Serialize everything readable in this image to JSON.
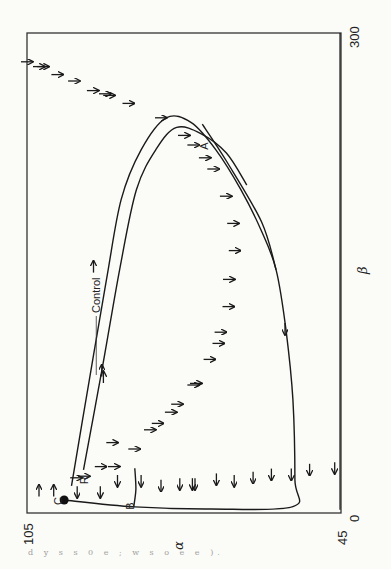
{
  "chart_data": {
    "type": "line",
    "title": "",
    "orientation": "rotated-90",
    "xlabel": "α",
    "ylabel": "β",
    "xlim": [
      105,
      45
    ],
    "ylim": [
      0,
      300
    ],
    "x_ticks": [
      "105",
      "45"
    ],
    "y_ticks": [
      "300",
      "0"
    ],
    "grid": false,
    "annotations": [
      {
        "text": "Control",
        "alpha": 91.0,
        "beta": 125
      },
      {
        "text": "A",
        "alpha": 70.5,
        "beta": 227
      },
      {
        "text": "B",
        "alpha": 84.6,
        "beta": 2
      },
      {
        "text": "C",
        "alpha": 98.3,
        "beta": 5
      },
      {
        "text": "R",
        "alpha": 93.3,
        "beta": 18
      }
    ],
    "points": [
      {
        "name": "C",
        "alpha": 97.9,
        "beta": 8.1
      }
    ],
    "series": [
      {
        "name": "outer-trajectory",
        "points": [
          [
            96.5,
            17
          ],
          [
            93.1,
            83
          ],
          [
            89.8,
            146
          ],
          [
            87.0,
            196
          ],
          [
            83.2,
            227
          ],
          [
            78.4,
            247
          ],
          [
            73.6,
            244
          ],
          [
            68.9,
            227
          ],
          [
            64.1,
            202
          ],
          [
            60.3,
            177
          ],
          [
            57.4,
            152
          ],
          [
            55.5,
            114
          ],
          [
            54.2,
            71
          ],
          [
            53.8,
            21
          ],
          [
            54.2,
            4
          ],
          [
            70.0,
            2.5
          ],
          [
            84.4,
            3.8
          ],
          [
            97.9,
            8.1
          ]
        ]
      },
      {
        "name": "inner-trajectory",
        "points": [
          [
            94.2,
            27
          ],
          [
            90.7,
            89
          ],
          [
            87.3,
            152
          ],
          [
            84.1,
            202
          ],
          [
            80.2,
            228
          ],
          [
            76.4,
            241
          ],
          [
            71.7,
            237
          ],
          [
            66.9,
            225
          ],
          [
            63.0,
            205
          ]
        ]
      },
      {
        "name": "tangent-A",
        "points": [
          [
            71.5,
            243
          ],
          [
            66.9,
            220
          ],
          [
            60.2,
            182
          ],
          [
            57.4,
            152
          ]
        ]
      },
      {
        "name": "B-branch",
        "points": [
          [
            84.6,
            4
          ],
          [
            84.2,
            15
          ],
          [
            84.4,
            28
          ]
        ]
      },
      {
        "name": "right-boundary",
        "points": [
          [
            45.2,
            300
          ],
          [
            45.2,
            2
          ]
        ]
      }
    ],
    "arrows": [
      {
        "alpha": 105.0,
        "beta": 282,
        "dir": "right"
      },
      {
        "alpha": 102.7,
        "beta": 279,
        "dir": "right"
      },
      {
        "alpha": 101.9,
        "beta": 279,
        "dir": "right"
      },
      {
        "alpha": 99.2,
        "beta": 274,
        "dir": "right"
      },
      {
        "alpha": 96.0,
        "beta": 270,
        "dir": "right"
      },
      {
        "alpha": 92.4,
        "beta": 264,
        "dir": "right"
      },
      {
        "alpha": 90.1,
        "beta": 262,
        "dir": "right"
      },
      {
        "alpha": 89.3,
        "beta": 261,
        "dir": "right"
      },
      {
        "alpha": 85.6,
        "beta": 256,
        "dir": "right"
      },
      {
        "alpha": 79.4,
        "beta": 247,
        "dir": "right"
      },
      {
        "alpha": 75.0,
        "beta": 236,
        "dir": "right"
      },
      {
        "alpha": 73.2,
        "beta": 230,
        "dir": "right"
      },
      {
        "alpha": 71.0,
        "beta": 222,
        "dir": "right"
      },
      {
        "alpha": 69.4,
        "beta": 215,
        "dir": "right"
      },
      {
        "alpha": 67.0,
        "beta": 198,
        "dir": "right"
      },
      {
        "alpha": 65.6,
        "beta": 181,
        "dir": "right"
      },
      {
        "alpha": 65.3,
        "beta": 164,
        "dir": "right"
      },
      {
        "alpha": 66.4,
        "beta": 146,
        "dir": "right"
      },
      {
        "alpha": 66.5,
        "beta": 129,
        "dir": "right"
      },
      {
        "alpha": 68.0,
        "beta": 113,
        "dir": "right"
      },
      {
        "alpha": 68.4,
        "beta": 106,
        "dir": "right"
      },
      {
        "alpha": 70.1,
        "beta": 96,
        "dir": "right"
      },
      {
        "alpha": 72.7,
        "beta": 81,
        "dir": "right"
      },
      {
        "alpha": 73.2,
        "beta": 80,
        "dir": "right"
      },
      {
        "alpha": 76.3,
        "beta": 68,
        "dir": "right"
      },
      {
        "alpha": 77.5,
        "beta": 63,
        "dir": "right"
      },
      {
        "alpha": 80.0,
        "beta": 56,
        "dir": "right"
      },
      {
        "alpha": 81.5,
        "beta": 52,
        "dir": "right"
      },
      {
        "alpha": 84.5,
        "beta": 40,
        "dir": "right"
      },
      {
        "alpha": 88.7,
        "beta": 44,
        "dir": "right"
      },
      {
        "alpha": 88.4,
        "beta": 29,
        "dir": "right"
      },
      {
        "alpha": 90.9,
        "beta": 29,
        "dir": "right"
      },
      {
        "alpha": 94.1,
        "beta": 23,
        "dir": "right"
      },
      {
        "alpha": 95.6,
        "beta": 22,
        "dir": "right"
      },
      {
        "alpha": 102.7,
        "beta": 14,
        "dir": "up"
      },
      {
        "alpha": 99.9,
        "beta": 14,
        "dir": "up"
      },
      {
        "alpha": 95.4,
        "beta": 13,
        "dir": "down"
      },
      {
        "alpha": 91.0,
        "beta": 13,
        "dir": "down"
      },
      {
        "alpha": 87.7,
        "beta": 20,
        "dir": "down"
      },
      {
        "alpha": 83.2,
        "beta": 20,
        "dir": "down"
      },
      {
        "alpha": 79.4,
        "beta": 17,
        "dir": "down"
      },
      {
        "alpha": 75.8,
        "beta": 18,
        "dir": "down"
      },
      {
        "alpha": 73.4,
        "beta": 18,
        "dir": "down"
      },
      {
        "alpha": 72.9,
        "beta": 18,
        "dir": "down"
      },
      {
        "alpha": 68.8,
        "beta": 21,
        "dir": "down"
      },
      {
        "alpha": 65.4,
        "beta": 20,
        "dir": "down"
      },
      {
        "alpha": 61.8,
        "beta": 22,
        "dir": "down"
      },
      {
        "alpha": 58.3,
        "beta": 24,
        "dir": "down"
      },
      {
        "alpha": 54.5,
        "beta": 24,
        "dir": "down"
      },
      {
        "alpha": 51.0,
        "beta": 27,
        "dir": "down"
      },
      {
        "alpha": 46.2,
        "beta": 28,
        "dir": "down"
      },
      {
        "alpha": 55.7,
        "beta": 115,
        "dir": "down"
      },
      {
        "alpha": 92.3,
        "beta": 154,
        "dir": "up"
      },
      {
        "alpha": 90.7,
        "beta": 89,
        "dir": "up"
      },
      {
        "alpha": 90.4,
        "beta": 85,
        "dir": "up"
      }
    ]
  },
  "page": {
    "bleed_text": "d y s s 0 e ; w s o e e )."
  }
}
